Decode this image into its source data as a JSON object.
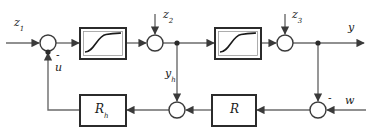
{
  "diagram": {
    "colors": {
      "line": "#6b6b6b",
      "block_border": "#2b2b2b",
      "block_fill": "#ffffff",
      "text": "#1a1a1a",
      "curve": "#1a1a1a"
    },
    "signals": [
      {
        "name": "z1",
        "base": "z",
        "sub": "1",
        "x": 14,
        "y": 20
      },
      {
        "name": "z2",
        "base": "z",
        "sub": "2",
        "x": 160,
        "y": 12
      },
      {
        "name": "z3",
        "base": "z",
        "sub": "3",
        "x": 290,
        "y": 12
      },
      {
        "name": "y",
        "base": "y",
        "sub": "",
        "x": 350,
        "y": 24
      },
      {
        "name": "u",
        "base": "u",
        "sub": "",
        "x": 55,
        "y": 68
      },
      {
        "name": "yh",
        "base": "y",
        "sub": "h",
        "x": 166,
        "y": 72
      },
      {
        "name": "w",
        "base": "w",
        "sub": "",
        "x": 346,
        "y": 98
      }
    ],
    "blocks": [
      {
        "name": "saturation-forward-1",
        "label": "",
        "kind": "saturation",
        "x": 80,
        "y": 28,
        "w": 46,
        "h": 31
      },
      {
        "name": "saturation-forward-2",
        "label": "",
        "kind": "saturation",
        "x": 215,
        "y": 28,
        "w": 46,
        "h": 31
      },
      {
        "name": "controller-rh",
        "label": "R",
        "sub": "h",
        "kind": "text",
        "x": 80,
        "y": 95,
        "w": 46,
        "h": 31
      },
      {
        "name": "controller-r",
        "label": "R",
        "sub": "",
        "kind": "text",
        "x": 212,
        "y": 95,
        "w": 44,
        "h": 31
      }
    ],
    "summing_junctions": [
      {
        "name": "sum-z1-u",
        "cx": 48,
        "cy": 43,
        "r": 8,
        "sign": "-",
        "sign_x": 56,
        "sign_y": 56
      },
      {
        "name": "sum-z2",
        "cx": 155,
        "cy": 43,
        "r": 8,
        "sign": "",
        "sign_x": 0,
        "sign_y": 0
      },
      {
        "name": "sum-z3",
        "cx": 285,
        "cy": 43,
        "r": 8,
        "sign": "",
        "sign_x": 0,
        "sign_y": 0
      },
      {
        "name": "sum-yh",
        "cx": 177,
        "cy": 110,
        "r": 8,
        "sign": "",
        "sign_x": 0,
        "sign_y": 0
      },
      {
        "name": "sum-w",
        "cx": 318,
        "cy": 110,
        "r": 8,
        "sign": "-",
        "sign_x": 329,
        "sign_y": 95
      }
    ],
    "branch_points": [
      {
        "name": "branch-yh",
        "cx": 177,
        "cy": 43
      },
      {
        "name": "branch-y",
        "cx": 318,
        "cy": 43
      },
      {
        "name": "branch-u",
        "cx": 48,
        "cy": 52
      }
    ],
    "signs": [
      {
        "name": "minus-sign-u-input",
        "glyph": "-"
      },
      {
        "name": "minus-sign-w-input",
        "glyph": "-"
      }
    ]
  }
}
